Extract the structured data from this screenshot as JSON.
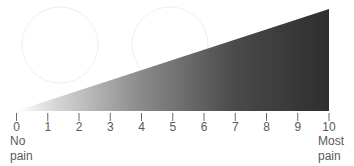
{
  "scale": {
    "type": "pain-rating-scale",
    "min": 0,
    "max": 10,
    "ticks": [
      "0",
      "1",
      "2",
      "3",
      "4",
      "5",
      "6",
      "7",
      "8",
      "9",
      "10"
    ],
    "left_anchor": {
      "line1": "No",
      "line2": "pain"
    },
    "right_anchor": {
      "line1": "Most",
      "line2": "pain"
    },
    "gradient": {
      "start_color": "#ffffff",
      "mid_color": "#9a9a9a",
      "end_color": "#2e2e2e"
    },
    "tick_color": "#6a6a6a"
  }
}
